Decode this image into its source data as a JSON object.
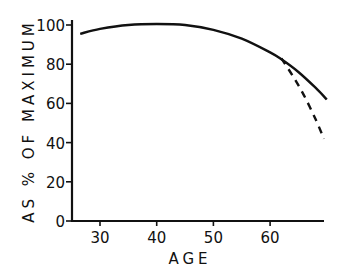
{
  "chart_data": {
    "type": "line",
    "title": "",
    "xlabel": "AGE",
    "ylabel": "AS % OF MAXIMUM",
    "xlim": [
      25,
      70
    ],
    "ylim": [
      0,
      100
    ],
    "x_ticks": [
      30,
      40,
      50,
      60
    ],
    "y_ticks": [
      0,
      20,
      40,
      60,
      80,
      100
    ],
    "grid": false,
    "legend": null,
    "series": [
      {
        "name": "solid",
        "style": "solid",
        "x": [
          26.5,
          30,
          35,
          40,
          45,
          50,
          55,
          60,
          62,
          65,
          68,
          70
        ],
        "y": [
          95.5,
          98,
          100,
          100.5,
          100,
          97.5,
          93,
          86,
          82.5,
          76,
          68,
          62
        ]
      },
      {
        "name": "dashed",
        "style": "dashed",
        "x": [
          62,
          64,
          66,
          68,
          69.5
        ],
        "y": [
          83,
          74,
          64,
          52,
          42
        ]
      }
    ]
  },
  "axes": {
    "x_title": "AGE",
    "y_title": "AS % OF MAXIMUM",
    "x_tick_labels": [
      "30",
      "40",
      "50",
      "60"
    ],
    "y_tick_labels": [
      "0",
      "20",
      "40",
      "60",
      "80",
      "100"
    ]
  }
}
